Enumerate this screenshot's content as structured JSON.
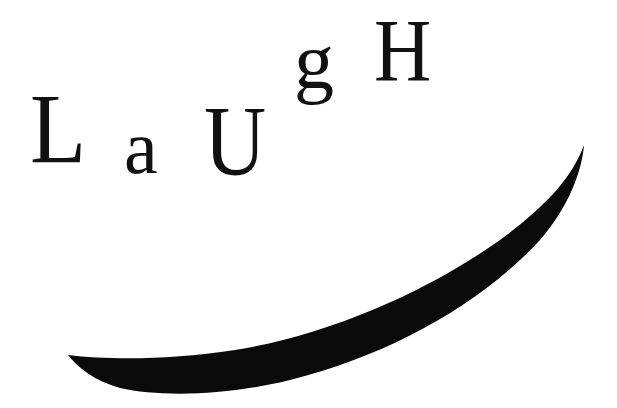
{
  "artwork": {
    "word": "LaUgH",
    "letters": [
      {
        "char": "L",
        "name": "letter-L"
      },
      {
        "char": "a",
        "name": "letter-a"
      },
      {
        "char": "U",
        "name": "letter-U"
      },
      {
        "char": "g",
        "name": "letter-g"
      },
      {
        "char": "H",
        "name": "letter-H"
      }
    ],
    "shape": {
      "name": "smile-crescent",
      "fill": "#0a0a0a"
    },
    "colors": {
      "background": "#ffffff",
      "ink": "#111111"
    }
  }
}
